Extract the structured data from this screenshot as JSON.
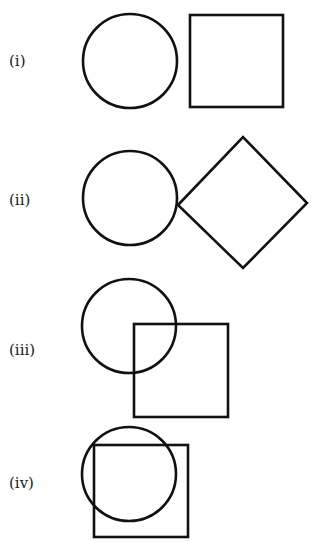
{
  "figures": [
    {
      "label": "(i)",
      "description": "circle and square separate (disjoint)",
      "circle": {
        "cx": 130,
        "cy": 61,
        "r": 47
      },
      "square": {
        "x": 190,
        "y": 15,
        "w": 93,
        "h": 92
      }
    },
    {
      "label": "(ii)",
      "description": "circle touching a diamond (square rotated 45°) at one point",
      "circle": {
        "cx": 130,
        "cy": 198,
        "r": 47
      },
      "diamond": {
        "points": "178,205 243,137 307,203 243,268"
      }
    },
    {
      "label": "(iii)",
      "description": "circle and square overlapping partially",
      "circle": {
        "cx": 129,
        "cy": 326,
        "r": 47
      },
      "square": {
        "x": 134,
        "y": 324,
        "w": 94,
        "h": 93
      }
    },
    {
      "label": "(iv)",
      "description": "circle mostly overlapping a square",
      "circle": {
        "cx": 129,
        "cy": 474,
        "r": 47
      },
      "square": {
        "x": 94,
        "y": 445,
        "w": 94,
        "h": 92
      }
    }
  ],
  "colors": {
    "stroke": "#111111",
    "background": "#ffffff",
    "text": "#1a1a1a"
  }
}
